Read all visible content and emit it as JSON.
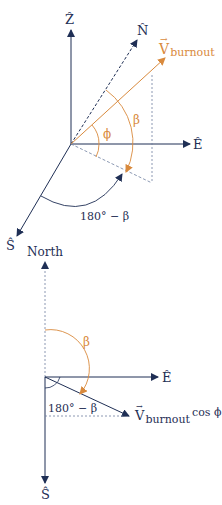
{
  "colors": {
    "axis": "#1f2f55",
    "accent": "#d98a3d",
    "dashed": "#6f7fa0"
  },
  "upper": {
    "z_label": "Ẑ",
    "n_label": "N̂",
    "e_label": "Ê",
    "s_label": "Ŝ",
    "v_label": "V",
    "v_sub": "burnout",
    "phi_label": "ϕ",
    "beta_label": "β",
    "supp_label": "180° − β"
  },
  "lower": {
    "north_label": "North",
    "e_label": "Ê",
    "s_label": "Ŝ",
    "beta_label": "β",
    "supp_label": "180° − β",
    "v_label": "V",
    "v_sub": "burnout",
    "v_suffix": "cos ϕ"
  }
}
